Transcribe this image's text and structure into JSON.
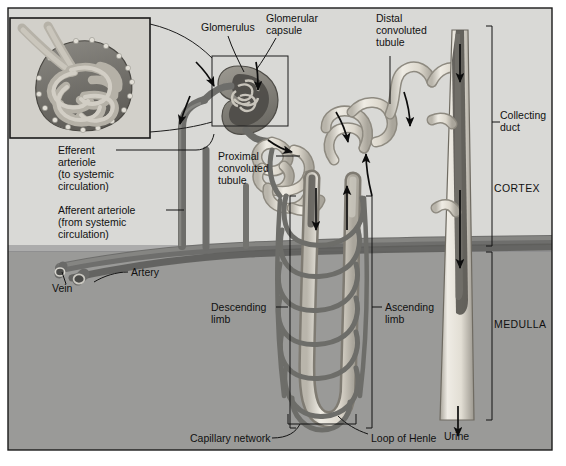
{
  "figure": {
    "regions": {
      "cortex": "CORTEX",
      "medulla": "MEDULLA"
    },
    "colors": {
      "cortex_bg": "#d9d9d6",
      "medulla_bg": "#9a9a98",
      "tubule_light": "#e8e5de",
      "vessel_dark": "#7a7a78",
      "frame": "#1a1a1a",
      "label_text": "#111111"
    }
  },
  "labels": {
    "glomerulus": "Glomerulus",
    "glomerular_capsule_l1": "Glomerular",
    "glomerular_capsule_l2": "capsule",
    "distal_l1": "Distal",
    "distal_l2": "convoluted",
    "distal_l3": "tubule",
    "collecting_l1": "Collecting",
    "collecting_l2": "duct",
    "cortex": "CORTEX",
    "medulla": "MEDULLA",
    "efferent_l1": "Efferent",
    "efferent_l2": "arteriole",
    "efferent_l3": "(to systemic",
    "efferent_l4": "circulation)",
    "afferent_l1": "Afferent arteriole",
    "afferent_l2": "(from systemic",
    "afferent_l3": "circulation)",
    "proximal_l1": "Proximal",
    "proximal_l2": "convoluted",
    "proximal_l3": "tubule",
    "vein": "Vein",
    "artery": "Artery",
    "descending_l1": "Descending",
    "descending_l2": "limb",
    "ascending_l1": "Ascending",
    "ascending_l2": "limb",
    "capillary_network": "Capillary network",
    "loop_of_henle": "Loop of Henle",
    "urine": "Urine"
  },
  "icons": {
    "inset": "glomerulus-inset-illustration",
    "flow_arrow": "flow-arrow-icon",
    "bracket": "range-bracket-icon",
    "leader": "leader-line-icon"
  }
}
